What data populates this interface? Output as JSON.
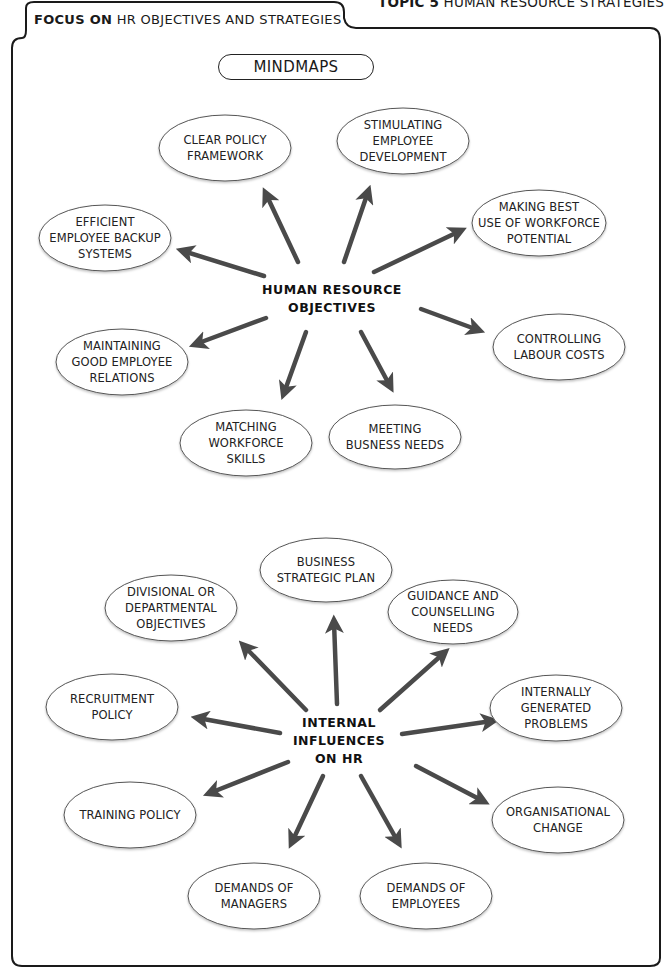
{
  "header": {
    "topic_bold": "TOPIC 5",
    "topic_rest": " HUMAN RESOURCE STRATEGIES"
  },
  "tab": {
    "focus_bold": "FOCUS ON",
    "focus_rest": " HR OBJECTIVES AND STRATEGIES"
  },
  "title": "MINDMAPS",
  "colors": {
    "arrow": "#4a4a4a",
    "ellipse_stroke": "#555555",
    "frame": "#1a1a1a"
  },
  "mindmap_objectives": {
    "hub": "HUMAN RESOURCE\nOBJECTIVES",
    "nodes": [
      {
        "label": "CLEAR POLICY\nFRAMEWORK"
      },
      {
        "label": "STIMULATING\nEMPLOYEE\nDEVELOPMENT"
      },
      {
        "label": "MAKING BEST\nUSE OF WORKFORCE\nPOTENTIAL"
      },
      {
        "label": "EFFICIENT\nEMPLOYEE BACKUP\nSYSTEMS"
      },
      {
        "label": "CONTROLLING\nLABOUR COSTS"
      },
      {
        "label": "MAINTAINING\nGOOD EMPLOYEE\nRELATIONS"
      },
      {
        "label": "MATCHING\nWORKFORCE\nSKILLS"
      },
      {
        "label": "MEETING\nBUSNESS NEEDS"
      }
    ]
  },
  "mindmap_influences": {
    "hub": "INTERNAL\nINFLUENCES\nON HR",
    "nodes": [
      {
        "label": "BUSINESS\nSTRATEGIC PLAN"
      },
      {
        "label": "DIVISIONAL OR\nDEPARTMENTAL\nOBJECTIVES"
      },
      {
        "label": "GUIDANCE AND\nCOUNSELLING\nNEEDS"
      },
      {
        "label": "RECRUITMENT\nPOLICY"
      },
      {
        "label": "INTERNALLY\nGENERATED\nPROBLEMS"
      },
      {
        "label": "TRAINING POLICY"
      },
      {
        "label": "ORGANISATIONAL\nCHANGE"
      },
      {
        "label": "DEMANDS OF\nMANAGERS"
      },
      {
        "label": "DEMANDS OF\nEMPLOYEES"
      }
    ]
  }
}
